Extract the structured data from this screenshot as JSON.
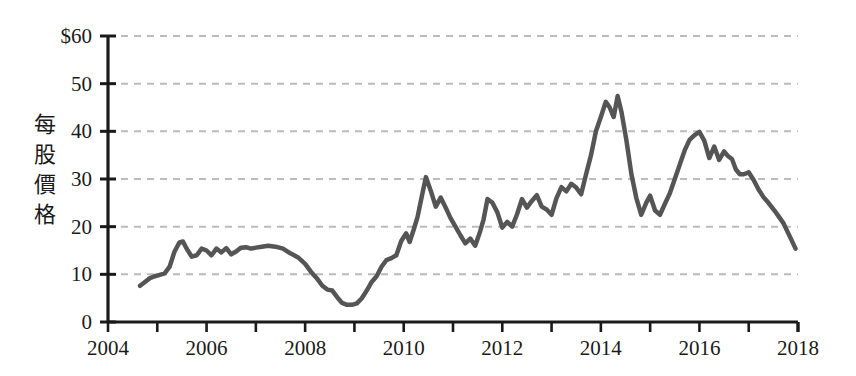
{
  "chart_data": {
    "type": "line",
    "title": "",
    "subtitle": "",
    "xlabel": "",
    "ylabel": "每股價格",
    "ylabel_chars": [
      "每",
      "股",
      "價",
      "格"
    ],
    "xlim": [
      2004,
      2018
    ],
    "ylim": [
      0,
      60
    ],
    "y_ticks": [
      0,
      10,
      20,
      30,
      40,
      50,
      60
    ],
    "y_tick_labels": [
      "0",
      "10",
      "20",
      "30",
      "40",
      "50",
      "$60"
    ],
    "x_ticks": [
      2004,
      2005,
      2006,
      2007,
      2008,
      2009,
      2010,
      2011,
      2012,
      2013,
      2014,
      2015,
      2016,
      2017,
      2018
    ],
    "x_tick_labels_major": [
      "2004",
      "2006",
      "2008",
      "2010",
      "2012",
      "2014",
      "2016",
      "2018"
    ],
    "x_major_values": [
      2004,
      2006,
      2008,
      2010,
      2012,
      2014,
      2016,
      2018
    ],
    "grid": "horizontal-dashed",
    "legend": "none",
    "currency_symbol": "$",
    "line_color": "#555555",
    "grid_color": "#bbbbbb",
    "axis_color": "#1a1a1a",
    "background_color": "#ffffff",
    "line_width": 4.5,
    "series": [
      {
        "name": "每股價格",
        "x": [
          2004.65,
          2004.75,
          2004.85,
          2004.95,
          2005.05,
          2005.15,
          2005.25,
          2005.35,
          2005.45,
          2005.52,
          2005.6,
          2005.7,
          2005.8,
          2005.9,
          2006.0,
          2006.1,
          2006.2,
          2006.3,
          2006.4,
          2006.5,
          2006.6,
          2006.7,
          2006.8,
          2006.9,
          2007.0,
          2007.12,
          2007.25,
          2007.4,
          2007.55,
          2007.7,
          2007.85,
          2008.0,
          2008.12,
          2008.25,
          2008.35,
          2008.45,
          2008.55,
          2008.65,
          2008.75,
          2008.85,
          2008.95,
          2009.05,
          2009.15,
          2009.25,
          2009.35,
          2009.45,
          2009.55,
          2009.65,
          2009.75,
          2009.85,
          2009.95,
          2010.05,
          2010.12,
          2010.2,
          2010.28,
          2010.36,
          2010.45,
          2010.55,
          2010.65,
          2010.75,
          2010.85,
          2010.95,
          2011.05,
          2011.15,
          2011.25,
          2011.35,
          2011.45,
          2011.55,
          2011.62,
          2011.7,
          2011.8,
          2011.9,
          2012.0,
          2012.1,
          2012.2,
          2012.3,
          2012.4,
          2012.5,
          2012.6,
          2012.7,
          2012.8,
          2012.9,
          2013.0,
          2013.1,
          2013.2,
          2013.3,
          2013.4,
          2013.5,
          2013.6,
          2013.7,
          2013.8,
          2013.9,
          2014.0,
          2014.1,
          2014.18,
          2014.26,
          2014.34,
          2014.42,
          2014.52,
          2014.62,
          2014.72,
          2014.82,
          2014.92,
          2015.0,
          2015.1,
          2015.2,
          2015.3,
          2015.4,
          2015.5,
          2015.6,
          2015.7,
          2015.8,
          2015.9,
          2016.0,
          2016.1,
          2016.2,
          2016.3,
          2016.4,
          2016.5,
          2016.58,
          2016.66,
          2016.74,
          2016.82,
          2016.9,
          2017.0,
          2017.1,
          2017.2,
          2017.3,
          2017.4,
          2017.55,
          2017.7,
          2017.85,
          2017.95
        ],
        "y": [
          7.6,
          8.4,
          9.2,
          9.6,
          9.9,
          10.2,
          11.6,
          14.8,
          16.7,
          16.9,
          15.3,
          13.7,
          14.0,
          15.4,
          15.0,
          14.0,
          15.4,
          14.6,
          15.5,
          14.2,
          14.8,
          15.6,
          15.7,
          15.4,
          15.6,
          15.8,
          16.0,
          15.8,
          15.4,
          14.4,
          13.6,
          12.2,
          10.5,
          9.0,
          7.6,
          6.8,
          6.6,
          5.2,
          4.0,
          3.6,
          3.6,
          3.9,
          5.0,
          6.6,
          8.4,
          9.6,
          11.6,
          13.0,
          13.4,
          14.0,
          17.0,
          18.6,
          16.8,
          19.3,
          22.0,
          26.0,
          30.4,
          27.5,
          24.2,
          26.1,
          24.0,
          21.8,
          20.0,
          18.2,
          16.5,
          17.5,
          16.0,
          19.0,
          21.5,
          25.8,
          25.0,
          23.0,
          19.8,
          21.0,
          20.0,
          22.6,
          25.8,
          24.0,
          25.4,
          26.6,
          24.2,
          23.6,
          22.5,
          26.0,
          28.3,
          27.4,
          29.0,
          28.2,
          26.8,
          31.0,
          35.0,
          40.0,
          43.0,
          46.2,
          45.0,
          43.0,
          47.4,
          44.0,
          38.0,
          31.0,
          26.0,
          22.5,
          25.0,
          26.5,
          23.4,
          22.5,
          24.8,
          27.0,
          30.0,
          33.0,
          36.0,
          38.2,
          39.2,
          39.9,
          38.0,
          34.4,
          36.8,
          34.0,
          35.8,
          34.8,
          34.2,
          32.0,
          31.0,
          31.0,
          31.4,
          29.8,
          27.8,
          26.2,
          25.0,
          23.0,
          20.8,
          17.6,
          15.4
        ]
      }
    ]
  },
  "axes": {
    "y_axis_name": "price-axis",
    "x_axis_name": "year-axis"
  }
}
